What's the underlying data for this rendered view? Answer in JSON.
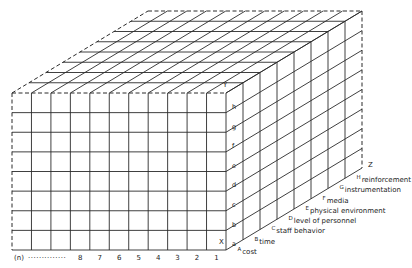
{
  "diagram": {
    "type": "3d-cube-grid",
    "axes": {
      "x_label": "X",
      "y_label": "Y",
      "z_label": "Z"
    },
    "x_axis_columns": {
      "first_label": "(n)",
      "dotted_leader": "··············",
      "labels": [
        "8",
        "7",
        "6",
        "5",
        "4",
        "3",
        "2",
        "1"
      ]
    },
    "y_axis_rows": [
      "a",
      "b",
      "c",
      "d",
      "e",
      "f",
      "g",
      "h"
    ],
    "z_axis_layers": [
      {
        "marker": "A",
        "label": "cost"
      },
      {
        "marker": "B",
        "label": "time"
      },
      {
        "marker": "C",
        "label": "staff behavior"
      },
      {
        "marker": "D",
        "label": "level of personnel"
      },
      {
        "marker": "E",
        "label": "physical environment"
      },
      {
        "marker": "F",
        "label": "media"
      },
      {
        "marker": "G",
        "label": "instrumentation"
      },
      {
        "marker": "H",
        "label": "reinforcement"
      }
    ],
    "colors": {
      "line": "#2a2a2a",
      "background": "#ffffff",
      "text": "#222222"
    }
  }
}
